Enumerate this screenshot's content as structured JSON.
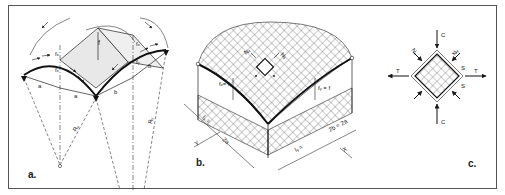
{
  "figure": {
    "colors": {
      "ink": "#1a1a1a",
      "line": "#222222",
      "shade": "#e6e6e6",
      "background": "#ffffff",
      "frame": "#555555"
    },
    "panels": [
      {
        "id": "a",
        "label": "a.",
        "annotations": {
          "f": "f",
          "fx_top": "fₓ",
          "fx_mid": "fₓ",
          "fy": "fᵧ",
          "fx_right": "fₓ",
          "a1": "a",
          "a2": "a",
          "b1": "b",
          "b2": "b",
          "Rx": "Rₓ",
          "Ry": "Rᵧ"
        }
      },
      {
        "id": "b",
        "label": "b.",
        "annotations": {
          "fx_eq_f": "fₓ= f",
          "fy_eq_f": "fᵧ = f",
          "Nx": "Nₓ",
          "Ny": "Nᵧ",
          "lx_eq": "lₓ =",
          "two_a": "2a",
          "ly_eq": "lᵧ =",
          "two_b_eq_two_a": "2b = 2a",
          "axis_y": "Y",
          "axis_x": "X"
        }
      },
      {
        "id": "c",
        "label": "c.",
        "annotations": {
          "C_top": "C",
          "C_bottom": "C",
          "T_left": "T",
          "T_right": "T",
          "Nx": "Nₓ",
          "Ny": "Nᵧ",
          "S_upper": "S",
          "S_lower": "S"
        }
      }
    ]
  }
}
